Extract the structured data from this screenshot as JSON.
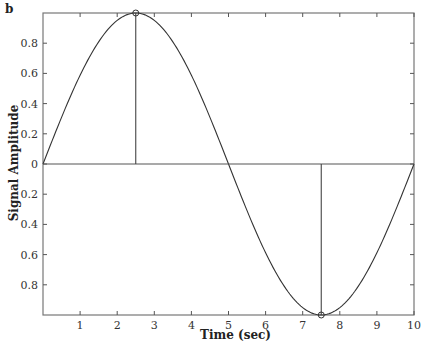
{
  "panel_label": "b",
  "chart_data": {
    "type": "line",
    "title": "",
    "xlabel": "Time (sec)",
    "ylabel": "Signal Amplitude",
    "xlim": [
      0,
      10
    ],
    "ylim": [
      -1,
      1
    ],
    "grid": false,
    "legend": null,
    "x_ticks": [
      1,
      2,
      3,
      4,
      5,
      6,
      7,
      8,
      9,
      10
    ],
    "y_ticks": [
      {
        "value": 0.8,
        "label": "0.8"
      },
      {
        "value": 0.6,
        "label": "0.6"
      },
      {
        "value": 0.4,
        "label": "0.4"
      },
      {
        "value": 0.2,
        "label": "0.2"
      },
      {
        "value": 0,
        "label": "0"
      },
      {
        "value": -0.2,
        "label": "0.2"
      },
      {
        "value": -0.4,
        "label": "0.4"
      },
      {
        "value": -0.6,
        "label": "0.6"
      },
      {
        "value": -0.8,
        "label": "0.8"
      }
    ],
    "series": [
      {
        "name": "sine",
        "function": "sin(2*pi*t/10)",
        "x": [
          0,
          0.5,
          1,
          1.5,
          2,
          2.5,
          3,
          3.5,
          4,
          4.5,
          5,
          5.5,
          6,
          6.5,
          7,
          7.5,
          8,
          8.5,
          9,
          9.5,
          10
        ],
        "values": [
          0,
          0.309,
          0.588,
          0.809,
          0.951,
          1.0,
          0.951,
          0.809,
          0.588,
          0.309,
          0,
          -0.309,
          -0.588,
          -0.809,
          -0.951,
          -1.0,
          -0.951,
          -0.809,
          -0.588,
          -0.309,
          0
        ]
      }
    ],
    "annotations": [
      {
        "type": "stem",
        "x": 2.5,
        "y": 1.0,
        "marker": "circle"
      },
      {
        "type": "stem",
        "x": 7.5,
        "y": -1.0,
        "marker": "circle"
      },
      {
        "type": "hline",
        "y": 0
      }
    ]
  }
}
